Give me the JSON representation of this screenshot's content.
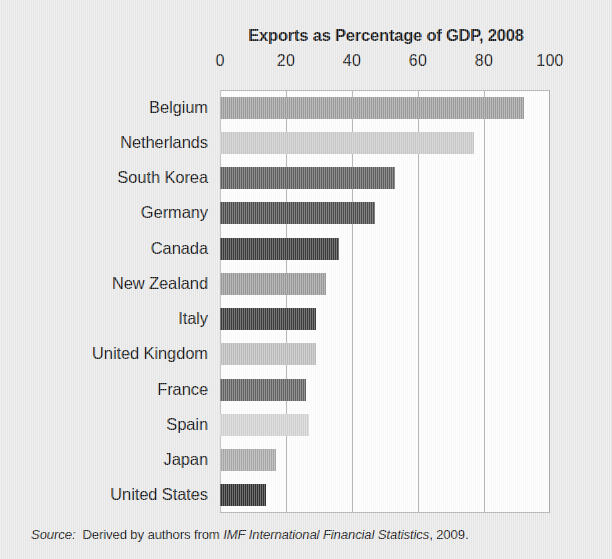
{
  "figure": {
    "background_color": "#e9e9e9",
    "plot_background_color": "#fdfdfd",
    "plot_border_color": "#aeaeae",
    "gridline_color": "#9a9a9a"
  },
  "source": {
    "prefix": "Source:",
    "body_before": "Derived by authors from ",
    "publication": "IMF International Financial Statistics",
    "body_after": ", 2009."
  },
  "chart_data": {
    "type": "bar",
    "orientation": "horizontal",
    "title": "Exports as Percentage of GDP, 2008",
    "xlabel": "",
    "ylabel": "",
    "xlim": [
      0,
      100
    ],
    "xticks": [
      0,
      20,
      40,
      60,
      80,
      100
    ],
    "xtick_labels": [
      "0",
      "20",
      "40",
      "60",
      "80",
      "100"
    ],
    "grid": true,
    "grid_axis": "x",
    "legend": false,
    "legend_position": "none",
    "categories": [
      "Belgium",
      "Netherlands",
      "South Korea",
      "Germany",
      "Canada",
      "New Zealand",
      "Italy",
      "United Kingdom",
      "France",
      "Spain",
      "Japan",
      "United States"
    ],
    "values": [
      92,
      77,
      53,
      47,
      36,
      32,
      29,
      29,
      26,
      27,
      17,
      14
    ],
    "bar_colors": [
      "#9d9d9d",
      "#c9c9c9",
      "#5e5e5e",
      "#4d4d4d",
      "#3b3b3b",
      "#9a9a9a",
      "#3c3c3c",
      "#bdbdbd",
      "#636363",
      "#d2d2d2",
      "#a9a9a9",
      "#323232"
    ]
  }
}
